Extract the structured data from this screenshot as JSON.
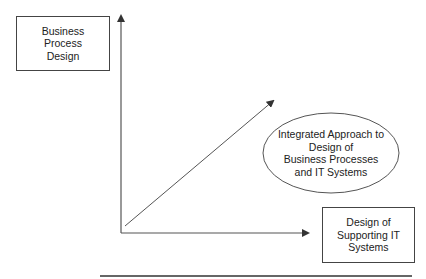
{
  "diagram": {
    "nodes": {
      "business_process_design": {
        "lines": [
          "Business",
          "Process",
          "Design"
        ]
      },
      "integrated_approach": {
        "lines": [
          "Integrated Approach to",
          "Design of",
          "Business Processes",
          "and IT Systems"
        ]
      },
      "supporting_it_systems": {
        "lines": [
          "Design of",
          "Supporting IT",
          "Systems"
        ]
      }
    },
    "axes": {
      "vertical": "Business Process Design",
      "horizontal": "Design of Supporting IT Systems",
      "diagonal": "Integrated Approach"
    },
    "colors": {
      "line": "#444444",
      "background": "#ffffff",
      "text": "#222222"
    }
  }
}
